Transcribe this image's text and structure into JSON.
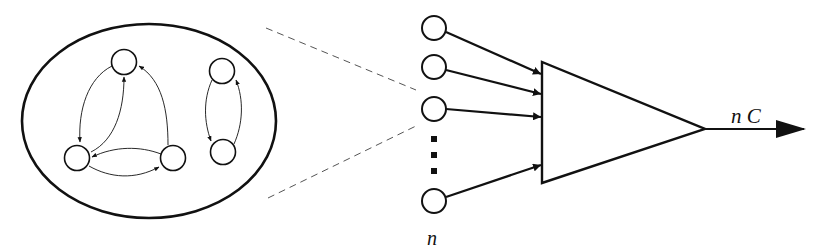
{
  "diagram": {
    "labels": {
      "input_count": "n",
      "output": "n C"
    },
    "network": {
      "node_count": 5,
      "cluster_a_nodes": 3,
      "cluster_b_nodes": 2
    },
    "inputs": {
      "visible_circles": 4,
      "ellipsis": "⋮"
    },
    "colors": {
      "stroke": "#111111",
      "background": "#ffffff",
      "dashed": "#555555"
    }
  }
}
